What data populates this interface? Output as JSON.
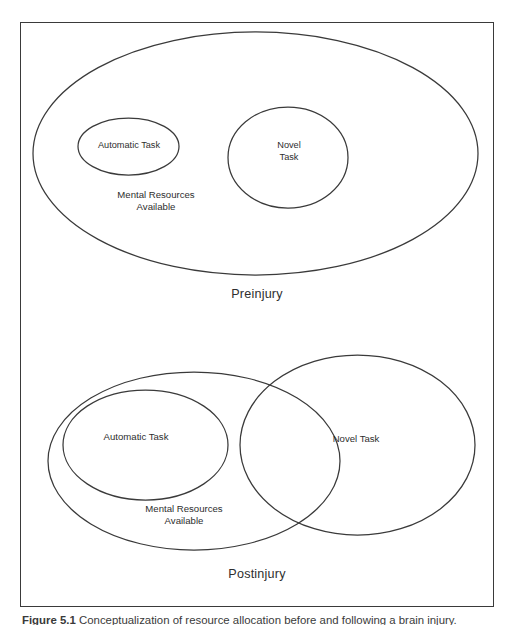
{
  "figure": {
    "caption_label": "Figure 5.1",
    "caption_text": "Conceptualization of resource allocation before and following a brain injury.",
    "border_color": "#3a3a3a",
    "shape_stroke_color": "#3a3a3a",
    "background_color": "#ffffff",
    "text_color": "#2e2e2e"
  },
  "panels": [
    {
      "id": "preinjury",
      "title": "Preinjury",
      "resources_label": "Mental Resources\nAvailable",
      "shapes": [
        {
          "name": "mental-resources-ellipse",
          "role": "container",
          "label": "Mental Resources Available"
        },
        {
          "name": "automatic-task-ellipse",
          "role": "task",
          "label": "Automatic Task"
        },
        {
          "name": "novel-task-ellipse",
          "role": "task",
          "label": "Novel\nTask"
        }
      ],
      "automatic_task_label": "Automatic Task",
      "novel_task_label": "Novel\nTask"
    },
    {
      "id": "postinjury",
      "title": "Postinjury",
      "resources_label": "Mental Resources\nAvailable",
      "shapes": [
        {
          "name": "mental-resources-ellipse",
          "role": "container",
          "label": "Mental Resources Available"
        },
        {
          "name": "automatic-task-ellipse",
          "role": "task",
          "label": "Automatic Task"
        },
        {
          "name": "novel-task-ellipse",
          "role": "task",
          "label": "Novel Task"
        }
      ],
      "automatic_task_label": "Automatic Task",
      "novel_task_label": "Novel Task"
    }
  ]
}
